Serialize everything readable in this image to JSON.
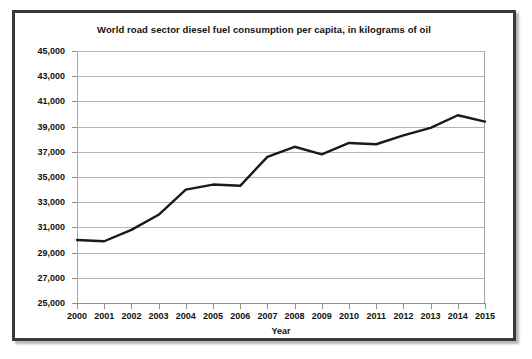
{
  "chart_data": {
    "type": "line",
    "title": "World road sector diesel fuel consumption per capita, in kilograms of oil",
    "xlabel": "Year",
    "ylabel": "",
    "x": [
      2000,
      2001,
      2002,
      2003,
      2004,
      2005,
      2006,
      2007,
      2008,
      2009,
      2010,
      2011,
      2012,
      2013,
      2014,
      2015
    ],
    "categories": [
      "2000",
      "2001",
      "2002",
      "2003",
      "2004",
      "2005",
      "2006",
      "2007",
      "2008",
      "2009",
      "2010",
      "2011",
      "2012",
      "2013",
      "2014",
      "2015"
    ],
    "values": [
      30000,
      29900,
      30800,
      32000,
      34000,
      34400,
      34300,
      36600,
      37400,
      36800,
      37700,
      37600,
      38300,
      38900,
      39900,
      39400
    ],
    "series": [
      {
        "name": "Diesel fuel consumption per capita",
        "values": [
          30000,
          29900,
          30800,
          32000,
          34000,
          34400,
          34300,
          36600,
          37400,
          36800,
          37700,
          37600,
          38300,
          38900,
          39900,
          39400
        ]
      }
    ],
    "xlim": [
      2000,
      2015
    ],
    "ylim": [
      25000,
      45000
    ],
    "ytick_step": 2000,
    "ytick_labels": [
      "45,000",
      "43,000",
      "41,000",
      "39,000",
      "37,000",
      "35,000",
      "33,000",
      "31,000",
      "29,000",
      "27,000",
      "25,000"
    ],
    "ytick_values": [
      45000,
      43000,
      41000,
      39000,
      37000,
      35000,
      33000,
      31000,
      29000,
      27000,
      25000
    ],
    "grid": true,
    "legend": false,
    "legend_position": "none",
    "line_color": "#1a1a1a",
    "grid_color": "#b4b4b4",
    "background_color": "#ffffff",
    "border_color": "#3a3a3a"
  }
}
